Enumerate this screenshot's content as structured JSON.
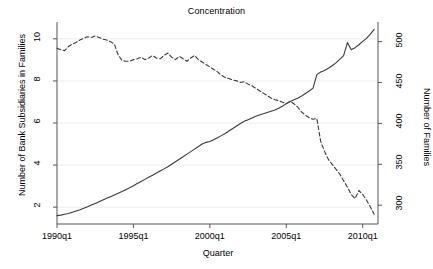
{
  "chart_data": {
    "type": "line",
    "title": "Concentration",
    "xlabel": "Quarter",
    "ylabel": "Number of Bank Subsidiaries in Families",
    "ylabel_right": "Number of Families",
    "grid": true,
    "legend": "none",
    "xlim": [
      1990.0,
      2011.0
    ],
    "ylim": [
      1.2,
      10.8
    ],
    "ylim_right": [
      277,
      524
    ],
    "xticks": [
      "1990q1",
      "1995q1",
      "2000q1",
      "2005q1",
      "2010q1"
    ],
    "xtick_values": [
      1990.0,
      1995.0,
      2000.0,
      2005.0,
      2010.0
    ],
    "yticks_left": [
      2,
      4,
      6,
      8,
      10
    ],
    "yticks_right": [
      300,
      350,
      400,
      450,
      500
    ],
    "series": [
      {
        "name": "Number of Bank Subsidiaries in Families",
        "axis": "left",
        "style": "solid",
        "color": "#3a3a3a",
        "x": [
          1990.0,
          1990.25,
          1990.5,
          1990.75,
          1991.0,
          1991.25,
          1991.5,
          1991.75,
          1992.0,
          1992.25,
          1992.5,
          1992.75,
          1993.0,
          1993.25,
          1993.5,
          1993.75,
          1994.0,
          1994.25,
          1994.5,
          1994.75,
          1995.0,
          1995.25,
          1995.5,
          1995.75,
          1996.0,
          1996.25,
          1996.5,
          1996.75,
          1997.0,
          1997.25,
          1997.5,
          1997.75,
          1998.0,
          1998.25,
          1998.5,
          1998.75,
          1999.0,
          1999.25,
          1999.5,
          1999.75,
          2000.0,
          2000.25,
          2000.5,
          2000.75,
          2001.0,
          2001.25,
          2001.5,
          2001.75,
          2002.0,
          2002.25,
          2002.5,
          2002.75,
          2003.0,
          2003.25,
          2003.5,
          2003.75,
          2004.0,
          2004.25,
          2004.5,
          2004.75,
          2005.0,
          2005.25,
          2005.5,
          2005.75,
          2006.0,
          2006.25,
          2006.5,
          2006.75,
          2007.0,
          2007.25,
          2007.5,
          2007.75,
          2008.0,
          2008.25,
          2008.5,
          2008.75,
          2009.0,
          2009.25,
          2009.5,
          2009.75,
          2010.0,
          2010.25,
          2010.5,
          2010.75
        ],
        "y": [
          1.6,
          1.62,
          1.66,
          1.7,
          1.76,
          1.82,
          1.88,
          1.95,
          2.02,
          2.1,
          2.18,
          2.26,
          2.34,
          2.42,
          2.5,
          2.58,
          2.66,
          2.74,
          2.83,
          2.92,
          3.02,
          3.12,
          3.22,
          3.32,
          3.42,
          3.52,
          3.62,
          3.72,
          3.82,
          3.92,
          4.04,
          4.16,
          4.28,
          4.4,
          4.52,
          4.64,
          4.76,
          4.88,
          5.0,
          5.08,
          5.12,
          5.2,
          5.3,
          5.4,
          5.5,
          5.62,
          5.74,
          5.86,
          5.98,
          6.08,
          6.16,
          6.24,
          6.32,
          6.38,
          6.44,
          6.5,
          6.56,
          6.62,
          6.7,
          6.8,
          6.92,
          7.02,
          7.1,
          7.18,
          7.28,
          7.4,
          7.52,
          7.66,
          8.3,
          8.42,
          8.5,
          8.6,
          8.72,
          8.86,
          9.02,
          9.2,
          9.82,
          9.48,
          9.58,
          9.72,
          9.88,
          10.02,
          10.22,
          10.45
        ],
        "note": "rises monotonically from ~1.6 in 1990q1 to ~10.5 in 2010q4, with a step jump in 2006-2007 and a local spike near 2008q4"
      },
      {
        "name": "Number of Families",
        "axis": "right",
        "style": "dashed",
        "color": "#3a3a3a",
        "x": [
          1990.0,
          1990.25,
          1990.5,
          1990.75,
          1991.0,
          1991.25,
          1991.5,
          1991.75,
          1992.0,
          1992.25,
          1992.5,
          1992.75,
          1993.0,
          1993.25,
          1993.5,
          1993.75,
          1994.0,
          1994.25,
          1994.5,
          1994.75,
          1995.0,
          1995.25,
          1995.5,
          1995.75,
          1996.0,
          1996.25,
          1996.5,
          1996.75,
          1997.0,
          1997.25,
          1997.5,
          1997.75,
          1998.0,
          1998.25,
          1998.5,
          1998.75,
          1999.0,
          1999.25,
          1999.5,
          1999.75,
          2000.0,
          2000.25,
          2000.5,
          2000.75,
          2001.0,
          2001.25,
          2001.5,
          2001.75,
          2002.0,
          2002.25,
          2002.5,
          2002.75,
          2003.0,
          2003.25,
          2003.5,
          2003.75,
          2004.0,
          2004.25,
          2004.5,
          2004.75,
          2005.0,
          2005.25,
          2005.5,
          2005.75,
          2006.0,
          2006.25,
          2006.5,
          2006.75,
          2007.0,
          2007.25,
          2007.5,
          2007.75,
          2008.0,
          2008.25,
          2008.5,
          2008.75,
          2009.0,
          2009.25,
          2009.5,
          2009.75,
          2010.0,
          2010.25,
          2010.5,
          2010.75
        ],
        "y": [
          492,
          490,
          489,
          494,
          497,
          499,
          502,
          504,
          506,
          505,
          507,
          505,
          503,
          502,
          500,
          497,
          484,
          477,
          476,
          476,
          478,
          479,
          481,
          478,
          480,
          483,
          480,
          479,
          483,
          486,
          481,
          478,
          482,
          479,
          476,
          480,
          483,
          478,
          475,
          472,
          469,
          466,
          463,
          459,
          456,
          455,
          453,
          452,
          450,
          451,
          448,
          446,
          443,
          440,
          437,
          434,
          431,
          429,
          428,
          426,
          424,
          427,
          424,
          420,
          414,
          410,
          407,
          405,
          406,
          378,
          366,
          356,
          350,
          344,
          338,
          330,
          322,
          313,
          308,
          318,
          313,
          306,
          298,
          289
        ],
        "note": "slowly declines from ~492 in 1990q1 to ~289 in 2010q4; peak ~507 around 1992, sharp drop after 2007q1, small rebound late 2009"
      }
    ]
  }
}
